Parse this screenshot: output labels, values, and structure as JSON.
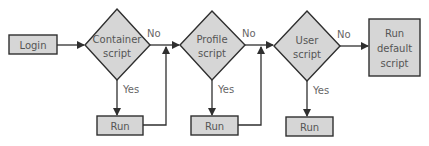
{
  "diagram": {
    "colors": {
      "fill": "#d6d6d6",
      "stroke": "#2f2f2f",
      "text": "#555555",
      "background": "#ffffff"
    },
    "nodes": {
      "login": {
        "label": "Login",
        "shape": "rectangle"
      },
      "container_script": {
        "line1": "Container",
        "line2": "script",
        "shape": "diamond"
      },
      "profile_script": {
        "line1": "Profile",
        "line2": "script",
        "shape": "diamond"
      },
      "user_script": {
        "line1": "User",
        "line2": "script",
        "shape": "diamond"
      },
      "run_default_script": {
        "line1": "Run",
        "line2": "default",
        "line3": "script",
        "shape": "rectangle"
      },
      "run_1": {
        "label": "Run",
        "shape": "rectangle"
      },
      "run_2": {
        "label": "Run",
        "shape": "rectangle"
      },
      "run_3": {
        "label": "Run",
        "shape": "rectangle"
      }
    },
    "edges": {
      "container_no": "No",
      "container_yes": "Yes",
      "profile_no": "No",
      "profile_yes": "Yes",
      "user_no": "No",
      "user_yes": "Yes"
    }
  }
}
